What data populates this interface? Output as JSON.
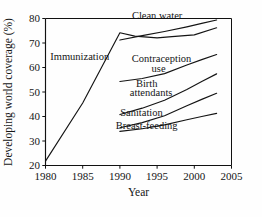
{
  "chart_data": {
    "type": "line",
    "title": "",
    "xlabel": "Year",
    "ylabel": "Developing world coverage (%)",
    "xlim": [
      1980,
      2005
    ],
    "ylim": [
      20,
      80
    ],
    "xticks": [
      "1980",
      "1985",
      "1990",
      "1995",
      "2000",
      "2005"
    ],
    "yticks": [
      "20",
      "30",
      "40",
      "50",
      "60",
      "70",
      "80"
    ],
    "grid": false,
    "legend_position": "inline-annotations",
    "series": [
      {
        "name": "Immunization",
        "label": "Immunization",
        "x": [
          1980,
          1985,
          1990,
          1992,
          1995,
          1997,
          2000,
          2003
        ],
        "values": [
          21.8,
          45.5,
          74.2,
          72.8,
          72.1,
          72.6,
          73.3,
          76.2
        ]
      },
      {
        "name": "Clean water",
        "label": "Clean water",
        "x": [
          1990,
          1993,
          1996,
          1999,
          2001,
          2003
        ],
        "values": [
          71.2,
          73.0,
          74.7,
          76.6,
          78.0,
          79.4
        ]
      },
      {
        "name": "Contraception use",
        "label_line1": "Contraception",
        "label_line2": "use",
        "x": [
          1990,
          1993,
          1996,
          1999,
          2001,
          2003
        ],
        "values": [
          54.3,
          55.5,
          57.5,
          61.0,
          63.2,
          65.3
        ]
      },
      {
        "name": "Birth attendants",
        "label_line1": "Birth",
        "label_line2": "attendants",
        "x": [
          1990,
          1993,
          1996,
          1999,
          2001,
          2003
        ],
        "values": [
          40.8,
          43.4,
          46.6,
          51.0,
          54.3,
          57.4
        ]
      },
      {
        "name": "Sanitation",
        "label": "Sanitation",
        "x": [
          1990,
          1993,
          1996,
          1999,
          2001,
          2003
        ],
        "values": [
          35.4,
          37.5,
          40.3,
          44.4,
          47.0,
          49.5
        ]
      },
      {
        "name": "Breast-feeding",
        "label": "Breast-feeding",
        "x": [
          1990,
          1993,
          1996,
          1999,
          2001,
          2003
        ],
        "values": [
          33.9,
          35.0,
          36.6,
          38.7,
          40.0,
          41.3
        ]
      }
    ],
    "annotations": [
      {
        "text": "Clean water",
        "x": 1995.0,
        "y": 79.6
      },
      {
        "text": "Immunization",
        "x": 1984.6,
        "y": 63.2
      },
      {
        "text": "Contraception",
        "x": 1995.6,
        "y": 62.4
      },
      {
        "text": "use",
        "x": 1995.2,
        "y": 58.2
      },
      {
        "text": "Birth",
        "x": 1993.6,
        "y": 52.2
      },
      {
        "text": "attendants",
        "x": 1994.2,
        "y": 48.2
      },
      {
        "text": "Sanitation",
        "x": 1992.9,
        "y": 40.3
      },
      {
        "text": "Breast-feeding",
        "x": 1993.6,
        "y": 34.8
      }
    ]
  }
}
